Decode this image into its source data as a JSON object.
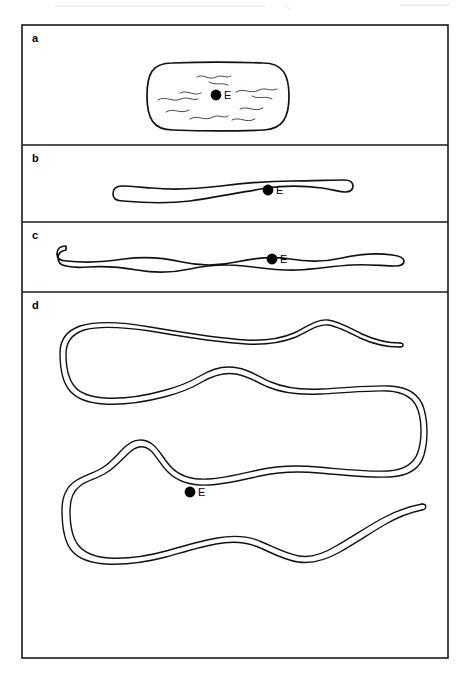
{
  "figure": {
    "background_color": "#ffffff",
    "line_color": "#111111",
    "frame_color": "#1a1a1a",
    "width": 468,
    "height": 683,
    "frame": {
      "x": 22,
      "y": 25,
      "width": 426,
      "height": 633
    }
  },
  "panels": [
    {
      "id": "a",
      "letter": "a",
      "letter_x": 32,
      "letter_y": 42,
      "divider_y": 25,
      "bounds": {
        "x": 22,
        "y": 25,
        "width": 426,
        "height": 120
      },
      "description": "Short rounded coccobacillary cell with internal wavy filaments",
      "marker": {
        "label": "E",
        "dot_x": 216,
        "dot_y": 95,
        "dot_r": 5.4,
        "label_x": 224,
        "label_y": 99
      }
    },
    {
      "id": "b",
      "letter": "b",
      "letter_x": 32,
      "letter_y": 162,
      "divider_y": 145,
      "bounds": {
        "x": 22,
        "y": 145,
        "width": 426,
        "height": 77
      },
      "description": "Elongated rod-shaped cell",
      "marker": {
        "label": "E",
        "dot_x": 268,
        "dot_y": 190,
        "dot_r": 5.4,
        "label_x": 276,
        "label_y": 194
      }
    },
    {
      "id": "c",
      "letter": "c",
      "letter_x": 32,
      "letter_y": 239,
      "divider_y": 222,
      "bounds": {
        "x": 22,
        "y": 222,
        "width": 426,
        "height": 70
      },
      "description": "Longer undulating filamentous cell",
      "marker": {
        "label": "E",
        "dot_x": 272,
        "dot_y": 259,
        "dot_r": 5.4,
        "label_x": 280,
        "label_y": 263
      }
    },
    {
      "id": "d",
      "letter": "d",
      "letter_x": 32,
      "letter_y": 309,
      "divider_y": 292,
      "bounds": {
        "x": 22,
        "y": 292,
        "width": 426,
        "height": 366
      },
      "description": "Very long serpentine filament coiled back and forth across the panel",
      "marker": {
        "label": "E",
        "dot_x": 190,
        "dot_y": 492,
        "dot_r": 5.4,
        "label_x": 198,
        "label_y": 496
      }
    }
  ],
  "legend": {
    "marker_symbol": "E",
    "marker_meaning": "E"
  }
}
